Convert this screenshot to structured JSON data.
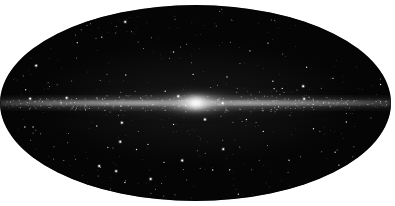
{
  "figure": {
    "name": "all-sky-map",
    "projection": "Mollweide",
    "caption": "",
    "background_color": "#ffffff",
    "sky_color": "#050505",
    "star_color": "#ffffff",
    "plane_color": "#d8d8d8",
    "core_color": "#ffffff"
  },
  "chart_data": {
    "type": "heatmap",
    "title": "",
    "subtitle": "",
    "xlabel": "",
    "ylabel": "",
    "projection": "Mollweide equal-area all-sky",
    "coordinate_system": "galactic",
    "grid": false,
    "legend": false,
    "xlim": [
      180,
      -180
    ],
    "ylim": [
      -90,
      90
    ],
    "center": {
      "l": 0,
      "b": 0
    },
    "ellipse": {
      "cx": 196,
      "cy": 103,
      "rx": 195,
      "ry": 98
    },
    "features": [
      {
        "name": "galactic-bulge",
        "l": 0,
        "b": 0,
        "peak_brightness": 1.0,
        "extent_l_deg": 45,
        "extent_b_deg": 14
      },
      {
        "name": "galactic-disk-band",
        "l_range": [
          -180,
          180
        ],
        "b_range": [
          -8,
          8
        ],
        "peak_brightness": 0.72
      },
      {
        "name": "diffuse-halo",
        "l_range": [
          -180,
          180
        ],
        "b_range": [
          -40,
          40
        ],
        "peak_brightness": 0.18
      }
    ],
    "star_count": 430
  },
  "annotations": []
}
